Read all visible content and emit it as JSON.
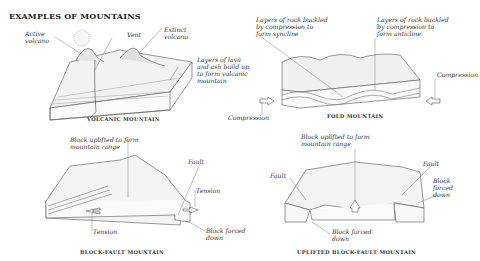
{
  "title": "EXAMPLES OF MOUNTAINS",
  "panels": {
    "volcanic": {
      "caption": "VOLCANIC MOUNTAIN",
      "labels": {
        "active": "Active\nvolcano",
        "vent": "Vent",
        "extinct": "Extinct\nvolcano",
        "layers": "Layers of lava\nand ash build up\nto form volcanic\nmountain"
      }
    },
    "fold": {
      "caption": "FOLD MOUNTAIN",
      "labels": {
        "syncline": "Layers of rock buckled\nby compression to\nform syncline",
        "anticline": "Layers of rock buckled\nby compression to\nform anticline",
        "compression_right": "Compression",
        "compression_left": "Compression"
      }
    },
    "block_fault": {
      "caption": "BLOCK-FAULT MOUNTAIN",
      "labels": {
        "uplifted": "Block uplifted to form\nmountain range",
        "fault": "Fault",
        "tension_right": "Tension",
        "tension_left": "Tension",
        "forced_down": "Block forced\ndown"
      }
    },
    "uplifted_block_fault": {
      "caption": "UPLIFTED BLOCK-FAULT MOUNTAIN",
      "labels": {
        "uplifted": "Block uplifted to form\nmountain range",
        "fault_left": "Fault",
        "fault_right": "Fault",
        "forced_down_right": "Block\nforced\ndown",
        "forced_down_bottom": "Block forced\ndown"
      }
    }
  }
}
